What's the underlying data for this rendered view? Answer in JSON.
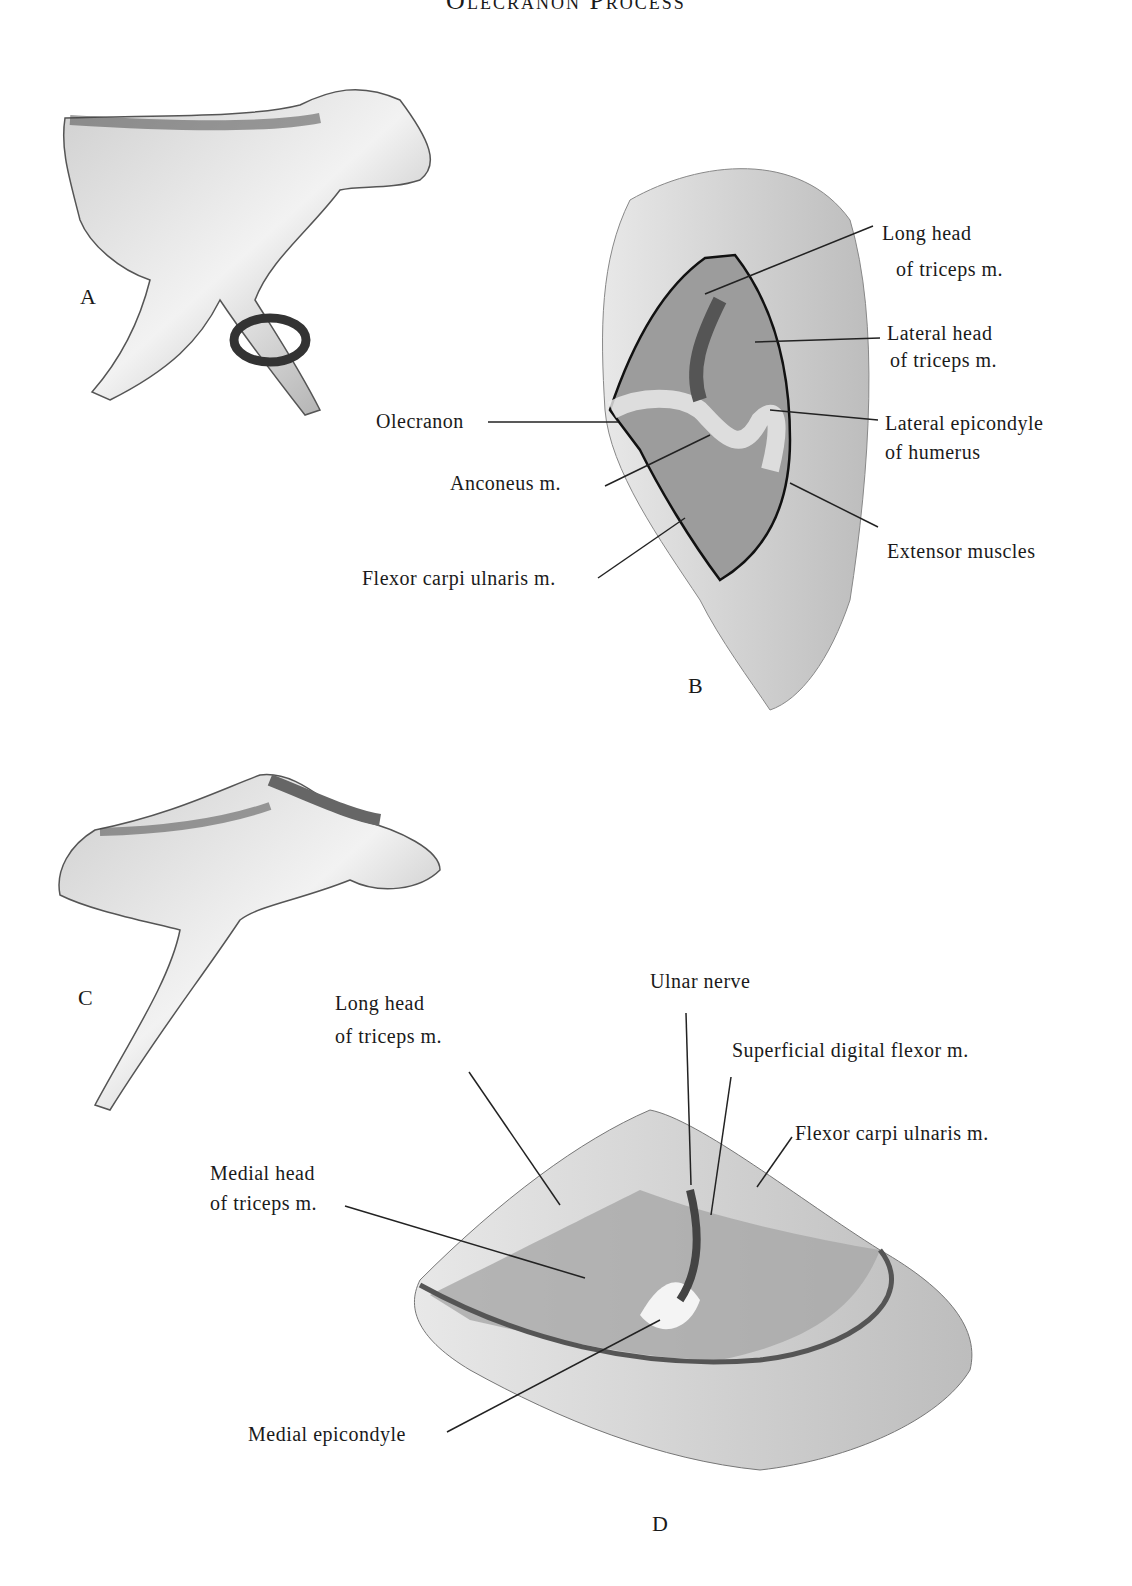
{
  "title": "Olecranon Process",
  "figures": {
    "A": {
      "letter": "A"
    },
    "B": {
      "letter": "B",
      "labels": {
        "long_head_1": "Long head",
        "long_head_2": "of triceps m.",
        "lateral_head_1": "Lateral head",
        "lateral_head_2": "of triceps m.",
        "lat_epicondyle_1": "Lateral epicondyle",
        "lat_epicondyle_2": "of humerus",
        "extensor": "Extensor muscles",
        "olecranon": "Olecranon",
        "anconeus": "Anconeus m.",
        "flexor_carpi": "Flexor carpi ulnaris m."
      }
    },
    "C": {
      "letter": "C"
    },
    "D": {
      "letter": "D",
      "labels": {
        "ulnar_nerve": "Ulnar nerve",
        "long_head_1": "Long head",
        "long_head_2": "of triceps m.",
        "superficial": "Superficial digital flexor m.",
        "flexor_carpi": "Flexor carpi ulnaris m.",
        "medial_head_1": "Medial head",
        "medial_head_2": "of triceps m.",
        "medial_epicondyle": "Medial epicondyle"
      }
    }
  }
}
